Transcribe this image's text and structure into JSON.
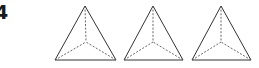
{
  "label": "4",
  "colors": {
    "solid_edge": "#333333",
    "hidden_edge": "#555555",
    "background": "#ffffff"
  },
  "pyramids": [
    {
      "name": "pyramid-1",
      "apex": [
        85,
        6
      ],
      "base_left": [
        55,
        60
      ],
      "base_right": [
        116,
        60
      ],
      "center": [
        86,
        42
      ]
    },
    {
      "name": "pyramid-2",
      "apex": [
        153,
        6
      ],
      "base_left": [
        124,
        60
      ],
      "base_right": [
        183,
        60
      ],
      "center": [
        153,
        42
      ]
    },
    {
      "name": "pyramid-3",
      "apex": [
        221,
        6
      ],
      "base_left": [
        192,
        60
      ],
      "base_right": [
        251,
        60
      ],
      "center": [
        221,
        42
      ]
    }
  ]
}
